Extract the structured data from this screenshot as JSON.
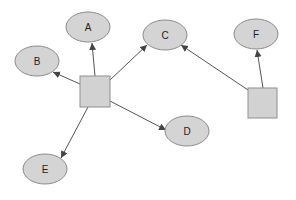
{
  "diagram": {
    "type": "directed-graph",
    "colors": {
      "node_fill": "#d4d4d4",
      "node_stroke": "#8a8a8a",
      "edge": "#555555",
      "background": "#ffffff"
    },
    "hubs": [
      {
        "id": "hub1",
        "shape": "square",
        "x": 80,
        "y": 76,
        "w": 30,
        "h": 31
      },
      {
        "id": "hub2",
        "shape": "square",
        "x": 248,
        "y": 88,
        "w": 29,
        "h": 30
      }
    ],
    "nodes": [
      {
        "id": "A",
        "label": "A",
        "cx": 88,
        "cy": 27,
        "rx": 22,
        "ry": 15
      },
      {
        "id": "B",
        "label": "B",
        "cx": 37,
        "cy": 61,
        "rx": 22,
        "ry": 15
      },
      {
        "id": "C",
        "label": "C",
        "cx": 165,
        "cy": 35,
        "rx": 22,
        "ry": 15
      },
      {
        "id": "D",
        "label": "D",
        "cx": 187,
        "cy": 131,
        "rx": 22,
        "ry": 15
      },
      {
        "id": "E",
        "label": "E",
        "cx": 45,
        "cy": 169,
        "rx": 22,
        "ry": 15
      },
      {
        "id": "F",
        "label": "F",
        "cx": 256,
        "cy": 34,
        "rx": 22,
        "ry": 15
      }
    ],
    "edges": [
      {
        "from": "hub1",
        "to": "A"
      },
      {
        "from": "hub1",
        "to": "B"
      },
      {
        "from": "hub1",
        "to": "C"
      },
      {
        "from": "hub1",
        "to": "D"
      },
      {
        "from": "hub1",
        "to": "E"
      },
      {
        "from": "hub2",
        "to": "C"
      },
      {
        "from": "hub2",
        "to": "F"
      }
    ]
  }
}
